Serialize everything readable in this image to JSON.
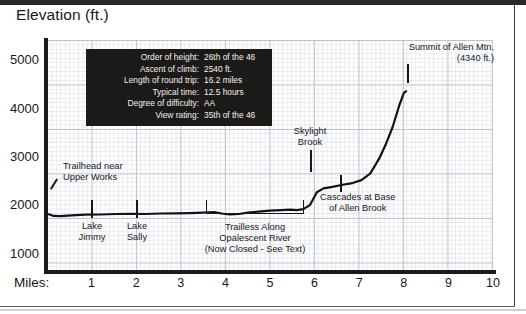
{
  "chart_title": "Elevation (ft.)",
  "axes": {
    "x_axis_label": "Miles:",
    "x_ticks": [
      1,
      2,
      3,
      4,
      5,
      6,
      7,
      8,
      9,
      10
    ],
    "y_ticks": [
      1000,
      2000,
      3000,
      4000,
      5000
    ],
    "xlim": [
      0,
      10
    ],
    "ylim": [
      600,
      5400
    ],
    "grid": true
  },
  "info_box": {
    "rows": [
      {
        "key": "Order of height:",
        "value": "26th of the 46"
      },
      {
        "key": "Ascent of climb:",
        "value": "2540 ft."
      },
      {
        "key": "Length of round trip:",
        "value": "16.2 miles"
      },
      {
        "key": "Typical time:",
        "value": "12.5 hours"
      },
      {
        "key": "Degree of difficulty:",
        "value": "AA"
      },
      {
        "key": "View rating:",
        "value": "35th of the 46"
      }
    ],
    "background_color": "#1c1a18",
    "text_color": "#f2f1ee"
  },
  "annotations": {
    "trailhead_line1": "Trailhead near",
    "trailhead_line2": "Upper Works",
    "lake_jimmy_line1": "Lake",
    "lake_jimmy_line2": "Jimmy",
    "lake_sally_line1": "Lake",
    "lake_sally_line2": "Sally",
    "trailless_line1": "Trailless Along",
    "trailless_line2": "Opalescent River",
    "trailless_line3": "(Now Closed - See Text)",
    "skylight_line1": "Skylight",
    "skylight_line2": "Brook",
    "cascades_line1": "Cascades at Base",
    "cascades_line2": "of Allen Brook",
    "summit_line1": "Summit of Allen Mtn.",
    "summit_line2": "(4340 ft.)"
  },
  "chart_data": {
    "type": "line",
    "title": "Elevation (ft.)",
    "xlabel": "Miles",
    "ylabel": "Elevation (ft.)",
    "xlim": [
      0,
      10
    ],
    "ylim": [
      600,
      5400
    ],
    "grid": true,
    "legend": null,
    "series": [
      {
        "name": "Allen Mtn. trail elevation profile",
        "x": [
          0.0,
          0.06,
          0.15,
          0.3,
          0.55,
          0.85,
          1.2,
          1.55,
          1.9,
          2.2,
          2.55,
          2.9,
          3.2,
          3.5,
          3.75,
          3.95,
          4.1,
          4.3,
          4.5,
          4.75,
          5.0,
          5.25,
          5.45,
          5.6,
          5.75,
          5.9,
          6.05,
          6.2,
          6.4,
          6.6,
          6.85,
          7.05,
          7.25,
          7.45,
          7.6,
          7.75,
          7.9,
          8.0,
          8.05
        ],
        "y": [
          1800,
          1790,
          1760,
          1755,
          1770,
          1785,
          1790,
          1800,
          1805,
          1800,
          1810,
          1815,
          1820,
          1830,
          1840,
          1805,
          1790,
          1800,
          1830,
          1850,
          1870,
          1880,
          1890,
          1880,
          1900,
          1990,
          2250,
          2330,
          2360,
          2400,
          2440,
          2500,
          2640,
          2950,
          3250,
          3600,
          4050,
          4300,
          4340
        ]
      }
    ],
    "annotated_points": [
      {
        "label": "Trailhead near Upper Works",
        "x": 0.05,
        "y": 1800
      },
      {
        "label": "Lake Jimmy",
        "x": 1.0,
        "y": 1790
      },
      {
        "label": "Lake Sally",
        "x": 2.0,
        "y": 1805
      },
      {
        "label": "Trailless Along Opalescent River (Now Closed - See Text)",
        "x_range": [
          3.55,
          5.7
        ]
      },
      {
        "label": "Skylight Brook",
        "x": 5.9,
        "y": 1990
      },
      {
        "label": "Cascades at Base of Allen Brook",
        "x": 6.55,
        "y": 2390
      },
      {
        "label": "Summit of Allen Mtn.",
        "x": 8.05,
        "y": 4340
      }
    ]
  }
}
